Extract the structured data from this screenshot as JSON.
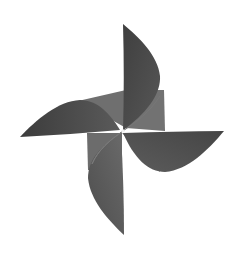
{
  "image": {
    "subject": "paper pinwheel",
    "background": "#ffffff",
    "colors": {
      "blade_dark": "#4a4a4a",
      "blade_mid": "#5e5e5e",
      "blade_light": "#707070",
      "pin": "#f2f2f2"
    }
  }
}
